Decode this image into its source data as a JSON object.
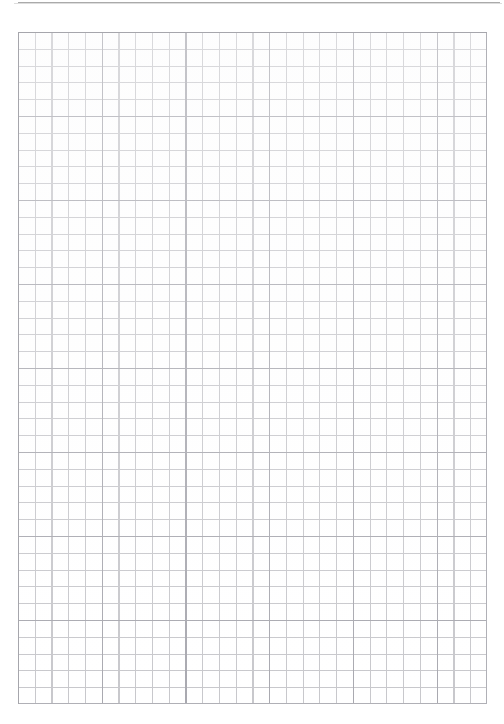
{
  "document": {
    "type": "graph-paper-sheet",
    "title": "",
    "body_text": "",
    "page_background_color": "#ffffff",
    "scan_edge_color": "#9b9b9b"
  },
  "grid": {
    "minor_line_color": "#c8c8cc",
    "major_line_color": "#a9a9b0",
    "border_color": "#b0b0b6",
    "cell_size_px": 16.75,
    "major_every_n_cells": 5,
    "columns": 28,
    "rows": 40,
    "origin_x_px": 18,
    "origin_y_px": 32,
    "width_px": 469,
    "height_px": 672
  },
  "canvas": {
    "width_px": 504,
    "height_px": 724
  },
  "annotations": []
}
